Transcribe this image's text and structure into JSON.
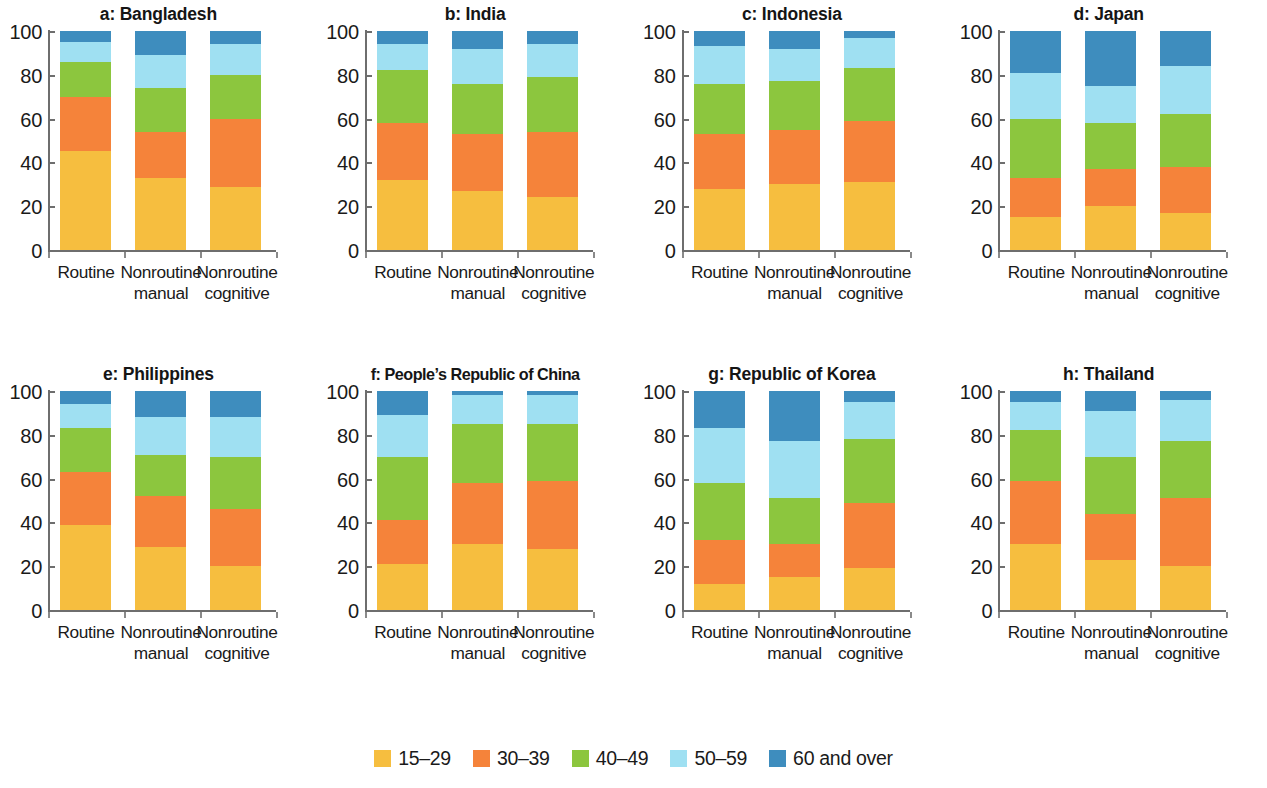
{
  "chart_data": {
    "type": "bar",
    "subtype": "stacked-bar-100-percent",
    "title": "",
    "xlabel": "",
    "ylabel": "",
    "ylim": [
      0,
      100
    ],
    "yticks": [
      0,
      20,
      40,
      60,
      80,
      100
    ],
    "grid": false,
    "legend_position": "bottom-center",
    "categories": [
      "Routine",
      "Nonroutine manual",
      "Nonroutine cognitive"
    ],
    "category_labels": [
      {
        "line1": "Routine",
        "line2": ""
      },
      {
        "line1": "Nonroutine",
        "line2": "manual"
      },
      {
        "line1": "Nonroutine",
        "line2": "cognitive"
      }
    ],
    "series_names": [
      "15–29",
      "30–39",
      "40–49",
      "50–59",
      "60 and over"
    ],
    "series_colors": [
      "#F6BE3F",
      "#F5833A",
      "#8CC63E",
      "#9FE0F2",
      "#3E8DBE"
    ],
    "panels": [
      {
        "id": "a",
        "title": "a: Bangladesh",
        "values": {
          "Routine": [
            45,
            25,
            16,
            9,
            5
          ],
          "Nonroutine manual": [
            33,
            21,
            20,
            15,
            11
          ],
          "Nonroutine cognitive": [
            29,
            31,
            20,
            14,
            6
          ]
        }
      },
      {
        "id": "b",
        "title": "b: India",
        "values": {
          "Routine": [
            32,
            26,
            24,
            12,
            6
          ],
          "Nonroutine manual": [
            27,
            26,
            23,
            16,
            8
          ],
          "Nonroutine cognitive": [
            24,
            30,
            25,
            15,
            6
          ]
        }
      },
      {
        "id": "c",
        "title": "c: Indonesia",
        "values": {
          "Routine": [
            28,
            25,
            23,
            17,
            7
          ],
          "Nonroutine manual": [
            30,
            25,
            22,
            15,
            8
          ],
          "Nonroutine cognitive": [
            31,
            28,
            24,
            14,
            3
          ]
        }
      },
      {
        "id": "d",
        "title": "d: Japan",
        "values": {
          "Routine": [
            15,
            18,
            27,
            21,
            19
          ],
          "Nonroutine manual": [
            20,
            17,
            21,
            17,
            25
          ],
          "Nonroutine cognitive": [
            17,
            21,
            24,
            22,
            16
          ]
        }
      },
      {
        "id": "e",
        "title": "e: Philippines",
        "values": {
          "Routine": [
            39,
            24,
            20,
            11,
            6
          ],
          "Nonroutine manual": [
            29,
            23,
            19,
            17,
            12
          ],
          "Nonroutine cognitive": [
            20,
            26,
            24,
            18,
            12
          ]
        }
      },
      {
        "id": "f",
        "title": "f: People’s Republic of China",
        "values": {
          "Routine": [
            21,
            20,
            29,
            19,
            11
          ],
          "Nonroutine manual": [
            30,
            28,
            27,
            13,
            2
          ],
          "Nonroutine cognitive": [
            28,
            31,
            26,
            13,
            2
          ]
        }
      },
      {
        "id": "g",
        "title": "g: Republic of Korea",
        "values": {
          "Routine": [
            12,
            20,
            26,
            25,
            17
          ],
          "Nonroutine manual": [
            15,
            15,
            21,
            26,
            23
          ],
          "Nonroutine cognitive": [
            19,
            30,
            29,
            17,
            5
          ]
        }
      },
      {
        "id": "h",
        "title": "h: Thailand",
        "values": {
          "Routine": [
            30,
            29,
            23,
            13,
            5
          ],
          "Nonroutine manual": [
            23,
            21,
            26,
            21,
            9
          ],
          "Nonroutine cognitive": [
            20,
            31,
            26,
            19,
            4
          ]
        }
      }
    ]
  },
  "legend": {
    "items": [
      {
        "label": "15–29",
        "color": "#F6BE3F",
        "swatch_name": "legend-swatch-15-29"
      },
      {
        "label": "30–39",
        "color": "#F5833A",
        "swatch_name": "legend-swatch-30-39"
      },
      {
        "label": "40–49",
        "color": "#8CC63E",
        "swatch_name": "legend-swatch-40-49"
      },
      {
        "label": "50–59",
        "color": "#9FE0F2",
        "swatch_name": "legend-swatch-50-59"
      },
      {
        "label": "60 and over",
        "color": "#3E8DBE",
        "swatch_name": "legend-swatch-60-and-over"
      }
    ]
  }
}
